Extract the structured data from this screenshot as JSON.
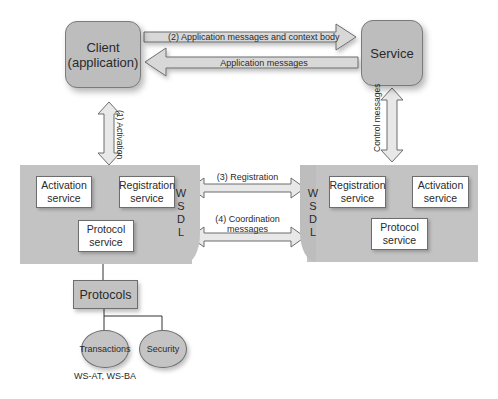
{
  "diagram": {
    "client": {
      "line1": "Client",
      "line2": "(application)"
    },
    "service": {
      "label": "Service"
    },
    "arrows": {
      "app_ctx": "(2) Application messages and context body",
      "app_msgs": "Application messages",
      "activation": "(1) Activation",
      "control": "Control messages",
      "registration": "(3) Registration",
      "coordination_line1": "(4) Coordination",
      "coordination_line2": "messages"
    },
    "left_coordinator": {
      "activation_service": {
        "line1": "Activation",
        "line2": "service"
      },
      "registration_service": {
        "line1": "Registration",
        "line2": "service"
      },
      "protocol_service": {
        "line1": "Protocol",
        "line2": "service"
      },
      "wsdl": [
        "W",
        "S",
        "D",
        "L"
      ]
    },
    "right_coordinator": {
      "registration_service": {
        "line1": "Registration",
        "line2": "service"
      },
      "activation_service": {
        "line1": "Activation",
        "line2": "service"
      },
      "protocol_service": {
        "line1": "Protocol",
        "line2": "service"
      },
      "wsdl": [
        "W",
        "S",
        "D",
        "L"
      ]
    },
    "protocols": {
      "label": "Protocols",
      "transactions": "Transactions",
      "security": "Security",
      "transactions_caption": "WS-AT, WS-BA"
    }
  },
  "colors": {
    "box_fill": "#bdbdbd",
    "panel_fill": "#c3c3c3",
    "arrow_fill": "#d6d6d6",
    "outline": "#6d6d6d"
  }
}
